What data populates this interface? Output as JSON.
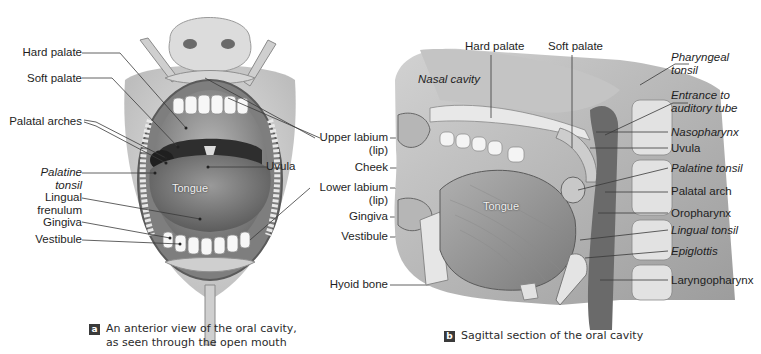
{
  "panel_a": {
    "labels": {
      "hard_palate": "Hard palate",
      "soft_palate": "Soft palate",
      "palatal_arches": "Palatal arches",
      "palatine_tonsil_1": "Palatine",
      "palatine_tonsil_2": "tonsil",
      "lingual_frenulum_1": "Lingual",
      "lingual_frenulum_2": "frenulum",
      "gingiva": "Gingiva",
      "vestibule": "Vestibule",
      "uvula": "Uvula",
      "tongue": "Tongue"
    },
    "caption": {
      "badge": "a",
      "line1": "An anterior view of the oral cavity,",
      "line2": "as seen through the open mouth"
    }
  },
  "shared_labels": {
    "upper_labium_1": "Upper labium",
    "upper_labium_2": "(lip)",
    "cheek": "Cheek",
    "lower_labium_1": "Lower labium",
    "lower_labium_2": "(lip)"
  },
  "panel_b": {
    "labels": {
      "hard_palate": "Hard palate",
      "soft_palate": "Soft palate",
      "nasal_cavity": "Nasal cavity",
      "gingiva": "Gingiva",
      "vestibule": "Vestibule",
      "hyoid_bone": "Hyoid bone",
      "tongue": "Tongue",
      "pharyngeal_tonsil_1": "Pharyngeal",
      "pharyngeal_tonsil_2": "tonsil",
      "auditory_tube_1": "Entrance to",
      "auditory_tube_2": "auditory tube",
      "nasopharynx": "Nasopharynx",
      "uvula": "Uvula",
      "palatine_tonsil": "Palatine tonsil",
      "palatal_arch": "Palatal arch",
      "oropharynx": "Oropharynx",
      "lingual_tonsil": "Lingual tonsil",
      "epiglottis": "Epiglottis",
      "laryngopharynx": "Laryngopharynx"
    },
    "caption": {
      "badge": "b",
      "line1": "Sagittal section of the oral cavity"
    }
  }
}
